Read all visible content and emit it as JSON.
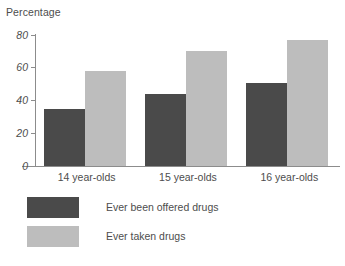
{
  "chart_data": {
    "type": "bar",
    "title": "",
    "ylabel": "Percentage",
    "xlabel": "",
    "categories": [
      "14 year-olds",
      "15 year-olds",
      "16 year-olds"
    ],
    "series": [
      {
        "name": "Ever been offered drugs",
        "color": "#4a4a4a",
        "values": [
          35,
          44,
          51
        ]
      },
      {
        "name": "Ever taken drugs",
        "color": "#bdbdbd",
        "values": [
          58,
          70,
          77
        ]
      }
    ],
    "ylim": [
      0,
      80
    ],
    "yticks": [
      0,
      20,
      40,
      60,
      80
    ],
    "ytick_labels": [
      "0",
      "20",
      "40",
      "60",
      "80"
    ],
    "grid": false,
    "legend_position": "bottom-left",
    "axis_color": "#8c8c8c",
    "text_color": "#4d4d4d",
    "background": "#ffffff"
  }
}
